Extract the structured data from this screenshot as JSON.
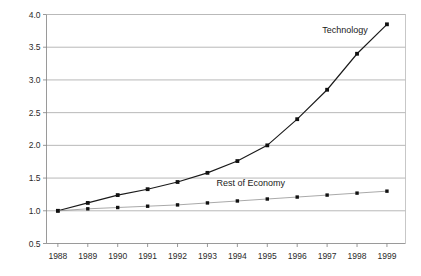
{
  "chart_data": {
    "type": "line",
    "title": "",
    "xlabel": "",
    "ylabel": "",
    "categories": [
      "1988",
      "1989",
      "1990",
      "1991",
      "1992",
      "1993",
      "1994",
      "1995",
      "1996",
      "1997",
      "1998",
      "1999"
    ],
    "x": [
      1988,
      1989,
      1990,
      1991,
      1992,
      1993,
      1994,
      1995,
      1996,
      1997,
      1998,
      1999
    ],
    "series": [
      {
        "name": "Technology",
        "values": [
          1.0,
          1.12,
          1.24,
          1.33,
          1.44,
          1.58,
          1.76,
          2.0,
          2.4,
          2.85,
          3.4,
          3.85
        ],
        "color": "#1a1a1a",
        "marker": "square",
        "label_x": 1997.6,
        "label_y": 3.72
      },
      {
        "name": "Rest of Economy",
        "values": [
          1.0,
          1.03,
          1.05,
          1.07,
          1.09,
          1.12,
          1.15,
          1.18,
          1.21,
          1.24,
          1.27,
          1.3
        ],
        "color": "#8c8c8c",
        "marker": "square",
        "label_x": 1994.45,
        "label_y": 1.38
      }
    ],
    "ylim": [
      0.5,
      4.0
    ],
    "yticks": [
      0.5,
      1.0,
      1.5,
      2.0,
      2.5,
      3.0,
      3.5,
      4.0
    ],
    "ytick_labels": [
      "0.5",
      "1.0",
      "1.5",
      "2.0",
      "2.5",
      "3.0",
      "3.5",
      "4.0"
    ],
    "xlim": [
      1987.62,
      1999.62
    ],
    "grid": "horizontal",
    "legend": "inline-annotations",
    "background": "#ffffff",
    "gridline_color": "#999999"
  }
}
